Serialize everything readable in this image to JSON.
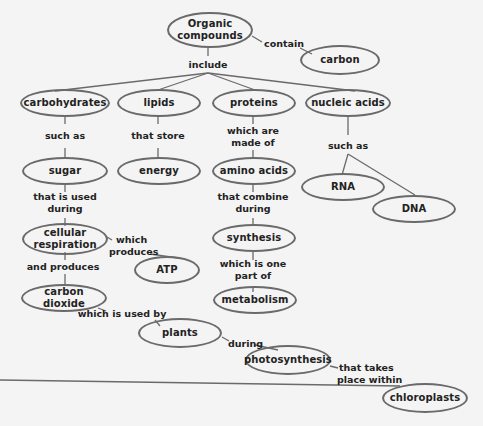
{
  "concept_map": {
    "title": "Organic compounds",
    "nodes": {
      "organic": {
        "label": "Organic compounds",
        "line1": "Organic",
        "line2": "compounds"
      },
      "carbon": {
        "label": "carbon"
      },
      "carbohydrates": {
        "label": "carbohydrates"
      },
      "lipids": {
        "label": "lipids"
      },
      "proteins": {
        "label": "proteins"
      },
      "nucleic_acids": {
        "label": "nucleic acids"
      },
      "sugar": {
        "label": "sugar"
      },
      "energy": {
        "label": "energy"
      },
      "amino_acids": {
        "label": "amino acids"
      },
      "rna": {
        "label": "RNA"
      },
      "dna": {
        "label": "DNA"
      },
      "cellular_respiration": {
        "label": "cellular respiration",
        "line1": "cellular",
        "line2": "respiration"
      },
      "atp": {
        "label": "ATP"
      },
      "synthesis": {
        "label": "synthesis"
      },
      "carbon_dioxide": {
        "label": "carbon dioxide"
      },
      "metabolism": {
        "label": "metabolism"
      },
      "plants": {
        "label": "plants"
      },
      "photosynthesis": {
        "label": "photosynthesis"
      },
      "chloroplasts": {
        "label": "chloroplasts"
      }
    },
    "links": {
      "contain": {
        "label": "contain"
      },
      "include": {
        "label": "include"
      },
      "such_as_carb": {
        "label": "such as"
      },
      "that_store": {
        "label": "that store"
      },
      "which_are_made_of": {
        "label": "which are made of",
        "line1": "which are",
        "line2": "made of"
      },
      "such_as_nucleic": {
        "label": "such as"
      },
      "that_is_used_during": {
        "label": "that is used during",
        "line1": "that is used",
        "line2": "during"
      },
      "that_combine_during": {
        "label": "that combine during",
        "line1": "that combine",
        "line2": "during"
      },
      "which_produces": {
        "label": "which produces",
        "line1": "which",
        "line2": "produces"
      },
      "and_produces": {
        "label": "and produces"
      },
      "which_is_one_part_of": {
        "label": "which is one part of",
        "line1": "which is one",
        "line2": "part of"
      },
      "which_is_used_by": {
        "label": "which is used by"
      },
      "during": {
        "label": "during"
      },
      "that_takes_place_within": {
        "label": "that takes place within",
        "line1": "that takes",
        "line2": "place within"
      }
    },
    "colors": {
      "background": "#f4f4f4",
      "stroke": "#6a6a6a",
      "text": "#222222"
    }
  }
}
